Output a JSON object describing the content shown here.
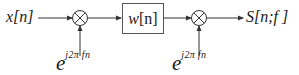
{
  "diagram": {
    "type": "signal-flow block diagram (short-time Fourier transform)",
    "input": {
      "label": "x[n]"
    },
    "blocks": [
      {
        "id": "mixer-1",
        "kind": "multiplier",
        "symbol": "⊗"
      },
      {
        "id": "window",
        "kind": "filter-box",
        "label_var": "w",
        "label_idx": "[n]"
      },
      {
        "id": "mixer-2",
        "kind": "multiplier",
        "symbol": "⊗"
      }
    ],
    "modulators": [
      {
        "target": "mixer-1",
        "base": "e",
        "exponent": "j2π fn"
      },
      {
        "target": "mixer-2",
        "base": "e",
        "exponent": "j2π fn"
      }
    ],
    "output": {
      "label": "S[n;f ]"
    },
    "colors": {
      "stroke": "#333333",
      "text": "#1a1a1a",
      "background": "#ffffff"
    }
  }
}
